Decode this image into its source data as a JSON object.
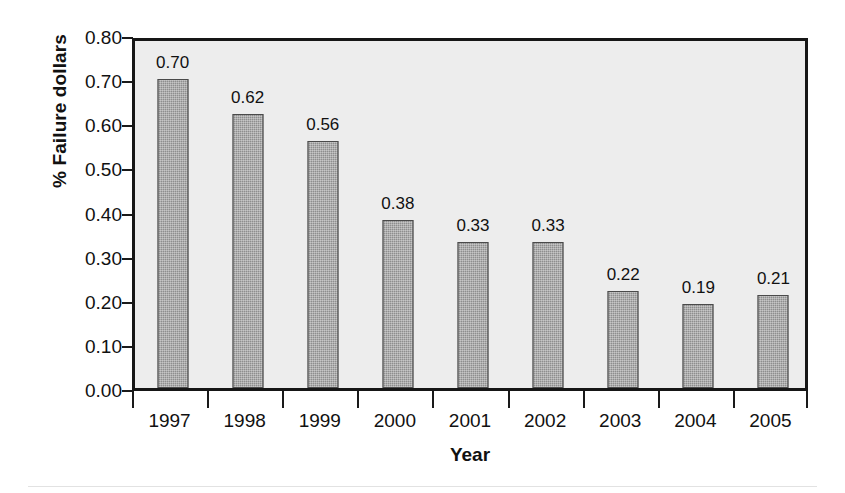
{
  "chart_data": {
    "type": "bar",
    "title": "",
    "xlabel": "Year",
    "ylabel": "% Failure dollars",
    "categories": [
      "1997",
      "1998",
      "1999",
      "2000",
      "2001",
      "2002",
      "2003",
      "2004",
      "2005"
    ],
    "values": [
      0.7,
      0.62,
      0.56,
      0.38,
      0.33,
      0.33,
      0.22,
      0.19,
      0.21
    ],
    "value_labels": [
      "0.70",
      "0.62",
      "0.56",
      "0.38",
      "0.33",
      "0.33",
      "0.22",
      "0.19",
      "0.21"
    ],
    "ylim": [
      0.0,
      0.8
    ],
    "ytick_labels": [
      "0.80",
      "0.70",
      "0.60",
      "0.50",
      "0.40",
      "0.30",
      "0.20",
      "0.10",
      "0.00"
    ],
    "ytick_values": [
      0.8,
      0.7,
      0.6,
      0.5,
      0.4,
      0.3,
      0.2,
      0.1,
      0.0
    ],
    "grid": false,
    "legend": "none",
    "show_data_labels": true,
    "colors": {
      "bar_fill": "#8e8e8e",
      "bar_edge": "#4a4a4a",
      "plot_background": "#ededed",
      "frame": "#161616",
      "text": "#111111",
      "figure_background": "#ffffff"
    }
  }
}
